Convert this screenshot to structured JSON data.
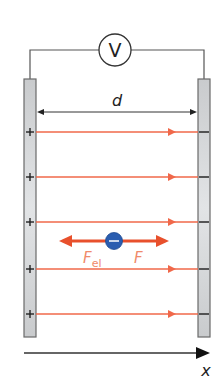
{
  "diagram": {
    "voltmeter": {
      "symbol": "V",
      "cx": 115,
      "cy": 50,
      "r": 16
    },
    "distance_label": "d",
    "axis_label": "x",
    "plates": {
      "left": {
        "x": 24,
        "y": 79,
        "width": 12,
        "height": 258,
        "sign": "+"
      },
      "right": {
        "x": 198,
        "y": 79,
        "width": 12,
        "height": 258,
        "sign": "−"
      }
    },
    "field_lines_y": [
      132,
      177,
      222,
      269,
      314
    ],
    "charge": {
      "cx": 114,
      "cy": 240,
      "r": 8,
      "sign": "−"
    },
    "forces": [
      {
        "name": "F",
        "subscript": "el",
        "direction": "left"
      },
      {
        "name": "F",
        "subscript": "",
        "direction": "right"
      }
    ],
    "colors": {
      "field_line": "#f0684a",
      "force_arrow": "#e8502c",
      "force_label": "#f08a6a",
      "charge": "#2a5db0",
      "plate_fill": "#d4d6d8",
      "plate_stroke": "#6a6a6a",
      "wire": "#555555",
      "text": "#222222"
    }
  }
}
